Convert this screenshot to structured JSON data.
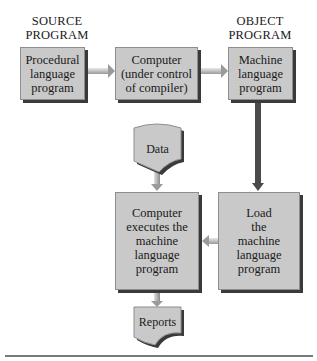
{
  "labels": {
    "source": [
      "SOURCE",
      "PROGRAM"
    ],
    "object": [
      "OBJECT",
      "PROGRAM"
    ]
  },
  "boxes": {
    "procedural": [
      "Procedural",
      "language",
      "program"
    ],
    "compiler": [
      "Computer",
      "(under control",
      "of compiler)"
    ],
    "machine": [
      "Machine",
      "language",
      "program"
    ],
    "executes": [
      "Computer",
      "executes the",
      "machine",
      "language",
      "program"
    ],
    "load": [
      "Load",
      "the",
      "machine",
      "language",
      "program"
    ]
  },
  "documents": {
    "data": "Data",
    "reports": "Reports"
  },
  "flows": [
    {
      "from": "procedural",
      "to": "compiler"
    },
    {
      "from": "compiler",
      "to": "machine"
    },
    {
      "from": "machine",
      "to": "load"
    },
    {
      "from": "data",
      "to": "executes"
    },
    {
      "from": "load",
      "to": "executes"
    },
    {
      "from": "executes",
      "to": "reports"
    }
  ],
  "colors": {
    "box_fill": "#c9c9c9",
    "box_shadow": "#3a3a3a",
    "arrow": "#b5b5b5"
  }
}
